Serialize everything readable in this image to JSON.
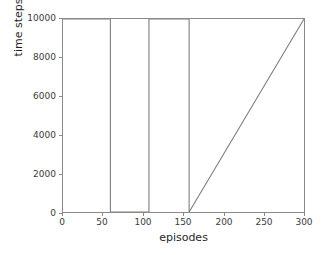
{
  "chart_data": {
    "type": "line",
    "title": "",
    "xlabel": "episodes",
    "ylabel": "time steps",
    "xlim": [
      0,
      300
    ],
    "ylim": [
      0,
      10000
    ],
    "xticks": [
      0,
      50,
      100,
      150,
      200,
      250,
      300
    ],
    "xticklabels": [
      "0",
      "50",
      "100",
      "150",
      "200",
      "250",
      "300"
    ],
    "yticks": [
      0,
      2000,
      4000,
      6000,
      8000,
      10000
    ],
    "yticklabels": [
      "0",
      "2000",
      "4000",
      "6000",
      "8000",
      "10000"
    ],
    "grid": false,
    "legend": null,
    "line_color": "#7f7f7f",
    "series": [
      {
        "name": "time steps",
        "x": [
          0,
          59,
          59,
          107,
          107,
          157,
          157,
          300
        ],
        "values": [
          10000,
          10000,
          0,
          0,
          10000,
          10000,
          0,
          10000
        ],
        "description": "Time steps held at the 10000 cap across all episodes except two narrow intervals where the value drops to 0: between episodes 59-107 and a single dip at episode 157."
      }
    ],
    "annotations": []
  },
  "axes": {
    "frame_color": "#8a8a8a",
    "tick_color": "#8a8a8a",
    "label_color": "#1f1f1f"
  }
}
